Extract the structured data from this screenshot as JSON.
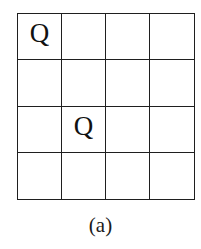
{
  "board": {
    "rows": 4,
    "cols": 4,
    "cells": [
      [
        "Q",
        "",
        "",
        ""
      ],
      [
        "",
        "",
        "",
        ""
      ],
      [
        "",
        "Q",
        "",
        ""
      ],
      [
        "",
        "",
        "",
        ""
      ]
    ],
    "piece_symbol": "Q"
  },
  "caption": "(a)"
}
